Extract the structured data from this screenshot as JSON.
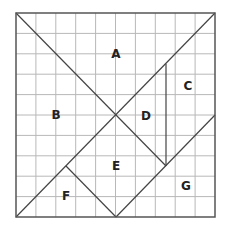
{
  "diagram": {
    "type": "tangram-square",
    "square": {
      "x": 16,
      "y": 13,
      "width": 199,
      "height": 204
    },
    "grid": {
      "rows": 10,
      "cols": 10,
      "color": "#b8b8b8"
    },
    "border_color": "#555555",
    "line_color": "#444444",
    "pieces": [
      {
        "label": "A",
        "x": 116,
        "y": 54
      },
      {
        "label": "B",
        "x": 56,
        "y": 115
      },
      {
        "label": "C",
        "x": 188,
        "y": 86
      },
      {
        "label": "D",
        "x": 146,
        "y": 116
      },
      {
        "label": "E",
        "x": 116,
        "y": 166
      },
      {
        "label": "F",
        "x": 66,
        "y": 196
      },
      {
        "label": "G",
        "x": 186,
        "y": 186
      }
    ],
    "cut_lines": [
      {
        "name": "diag-topleft-to-center-low",
        "x1": 16,
        "y1": 13,
        "x2": 166,
        "y2": 166
      },
      {
        "name": "diag-topright-to-bottomleft",
        "x1": 215,
        "y1": 13,
        "x2": 16,
        "y2": 217
      },
      {
        "name": "vertical-d-c-divider",
        "x1": 166,
        "y1": 64,
        "x2": 166,
        "y2": 166
      },
      {
        "name": "diag-bottommid-to-rightmid",
        "x1": 116,
        "y1": 217,
        "x2": 215,
        "y2": 115
      },
      {
        "name": "diag-f-e-divider",
        "x1": 66,
        "y1": 166,
        "x2": 116,
        "y2": 217
      }
    ]
  }
}
